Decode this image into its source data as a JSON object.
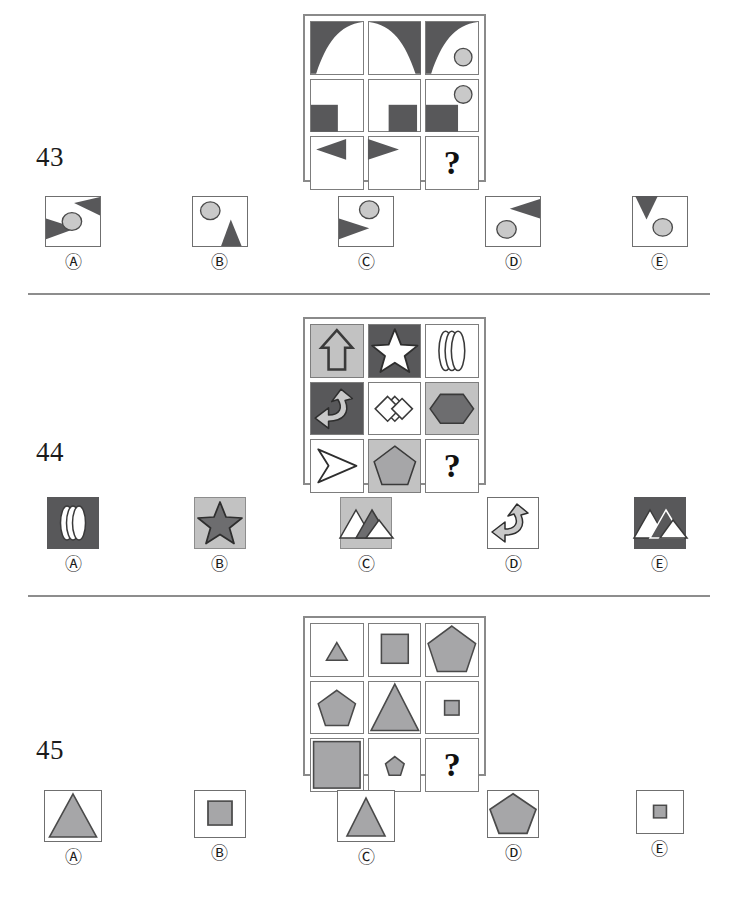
{
  "page": {
    "background": "#ffffff",
    "colors": {
      "dark_gray": "#58585a",
      "mid_gray": "#a6a6a8",
      "light_gray": "#c9c9c9",
      "outline": "#4a4a4a",
      "box_border": "#6f6f6f",
      "divider": "#8d8d8d"
    }
  },
  "questions": [
    {
      "number": "43",
      "question_mark": "?",
      "matrix": {
        "rows": [
          [
            "curved-triangle-top-left-dark",
            "curved-triangle-top-right-dark",
            "curved-triangle-top-left-dark-with-circle-bottom-right"
          ],
          [
            "square-bottom-left-dark",
            "square-bottom-center-dark",
            "square-bottom-left-dark-with-circle-top-right"
          ],
          [
            "arrowhead-left-dark",
            "arrowhead-right-dark",
            "question-mark"
          ]
        ]
      },
      "options": [
        {
          "label": "Ⓐ",
          "letter": "A",
          "name": "triangle-right-top-plus-triangle-right-bottom-and-circle"
        },
        {
          "label": "Ⓑ",
          "letter": "B",
          "name": "circle-top-left-plus-triangle-bottom-right"
        },
        {
          "label": "Ⓒ",
          "letter": "C",
          "name": "arrowhead-right-plus-circle-top-right"
        },
        {
          "label": "Ⓓ",
          "letter": "D",
          "name": "arrowhead-left-top-plus-circle-bottom-left"
        },
        {
          "label": "Ⓔ",
          "letter": "E",
          "name": "triangle-down-top-left-plus-circle-bottom"
        }
      ]
    },
    {
      "number": "44",
      "question_mark": "?",
      "matrix": {
        "rows": [
          [
            "up-arrow-outline-on-light-gray",
            "five-point-star-white-on-dark-gray",
            "stacked-discs-outline-on-white"
          ],
          [
            "curved-arrow-light-on-dark-gray",
            "double-diamond-outline-on-white",
            "hexagon-dark-on-light-gray"
          ],
          [
            "arrowhead-right-outline-on-white",
            "pentagon-gray-on-light-gray",
            "question-mark"
          ]
        ]
      },
      "options": [
        {
          "label": "Ⓐ",
          "letter": "A",
          "name": "stacked-discs-on-dark-gray"
        },
        {
          "label": "Ⓑ",
          "letter": "B",
          "name": "star-dark-on-light-gray"
        },
        {
          "label": "Ⓒ",
          "letter": "C",
          "name": "mountains-on-light-gray"
        },
        {
          "label": "Ⓓ",
          "letter": "D",
          "name": "curved-arrow-on-white"
        },
        {
          "label": "Ⓔ",
          "letter": "E",
          "name": "mountains-on-dark-gray"
        }
      ]
    },
    {
      "number": "45",
      "question_mark": "?",
      "matrix": {
        "rows": [
          [
            "triangle-small",
            "square-medium",
            "pentagon-large"
          ],
          [
            "pentagon-medium",
            "triangle-large",
            "square-small"
          ],
          [
            "square-large",
            "pentagon-small",
            "question-mark"
          ]
        ]
      },
      "options": [
        {
          "label": "Ⓐ",
          "letter": "A",
          "name": "triangle-large"
        },
        {
          "label": "Ⓑ",
          "letter": "B",
          "name": "square-medium"
        },
        {
          "label": "Ⓒ",
          "letter": "C",
          "name": "triangle-medium"
        },
        {
          "label": "Ⓓ",
          "letter": "D",
          "name": "pentagon-large"
        },
        {
          "label": "Ⓔ",
          "letter": "E",
          "name": "square-small"
        }
      ]
    }
  ]
}
